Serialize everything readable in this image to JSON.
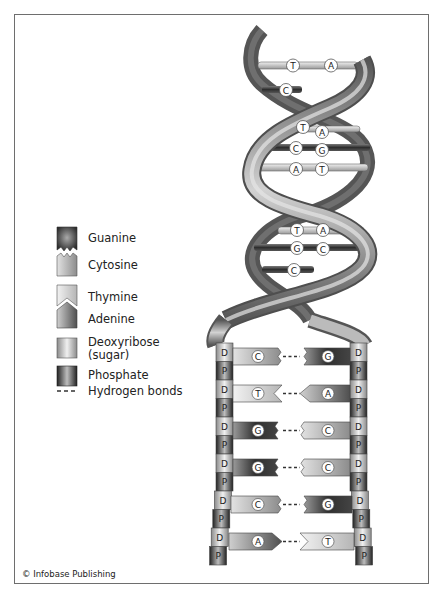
{
  "figure": {
    "credit": "© Infobase Publishing"
  },
  "legend": {
    "items": [
      {
        "key": "guanine",
        "label": "Guanine",
        "icon": "guanine-block-icon"
      },
      {
        "key": "cytosine",
        "label": "Cytosine",
        "icon": "cytosine-block-icon"
      },
      {
        "key": "thymine",
        "label": "Thymine",
        "icon": "thymine-block-icon"
      },
      {
        "key": "adenine",
        "label": "Adenine",
        "icon": "adenine-block-icon"
      },
      {
        "key": "deoxyribose",
        "label": "Deoxyribose",
        "label2": "(sugar)",
        "icon": "deoxyribose-block-icon"
      },
      {
        "key": "phosphate",
        "label": "Phosphate",
        "icon": "phosphate-block-icon"
      },
      {
        "key": "hydrogen_bonds",
        "label": "Hydrogen bonds",
        "icon": "dashed-line-icon"
      }
    ]
  },
  "helix": {
    "base_pairs": [
      {
        "left": "T",
        "right": "A"
      },
      {
        "left": "C",
        "right": ""
      },
      {
        "left": "T",
        "right": "A"
      },
      {
        "left": "C",
        "right": "G"
      },
      {
        "left": "A",
        "right": "T"
      },
      {
        "left": "T",
        "right": "A"
      },
      {
        "left": "G",
        "right": "C"
      },
      {
        "left": "C",
        "right": ""
      }
    ]
  },
  "ladder": {
    "left_strand": [
      "D",
      "P",
      "D",
      "P",
      "D",
      "P",
      "D",
      "P",
      "D",
      "P",
      "D",
      "P"
    ],
    "right_strand": [
      "D",
      "P",
      "D",
      "P",
      "D",
      "P",
      "D",
      "P",
      "D",
      "P",
      "D",
      "P"
    ],
    "rungs": [
      {
        "left": "C",
        "right": "G"
      },
      {
        "left": "T",
        "right": "A"
      },
      {
        "left": "G",
        "right": "C"
      },
      {
        "left": "G",
        "right": "C"
      },
      {
        "left": "C",
        "right": "G"
      },
      {
        "left": "A",
        "right": "T"
      }
    ]
  },
  "colors": {
    "frame": "#6e6e6e",
    "strand_dark": "#4a4a4a",
    "strand_light": "#d8d8d8",
    "guanine": "#3a3a3a",
    "cytosine": "#bdbdbd",
    "thymine": "#e6e6e6",
    "adenine": "#7a7a7a"
  }
}
